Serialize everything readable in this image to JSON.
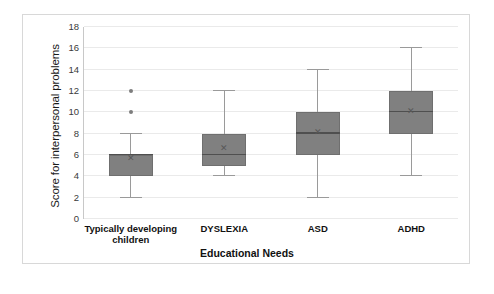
{
  "chart_data": {
    "type": "box",
    "title": "",
    "xlabel": "Educational  Needs",
    "ylabel": "Score for interpersonal problems",
    "ylim": [
      0,
      18
    ],
    "yticks": [
      0,
      2,
      4,
      6,
      8,
      10,
      12,
      14,
      16,
      18
    ],
    "grid": true,
    "legend": "none",
    "categories": [
      "Typically developing children",
      "DYSLEXIA",
      "ASD",
      "ADHD"
    ],
    "boxes": [
      {
        "category": "Typically developing children",
        "whisker_low": 2,
        "q1": 4,
        "median": 6,
        "q3": 6,
        "whisker_high": 8,
        "mean": 5.7,
        "outliers": [
          10,
          12
        ]
      },
      {
        "category": "DYSLEXIA",
        "whisker_low": 4,
        "q1": 5,
        "median": 6,
        "q3": 8,
        "whisker_high": 12,
        "mean": 6.7,
        "outliers": []
      },
      {
        "category": "ASD",
        "whisker_low": 2,
        "q1": 6,
        "median": 8,
        "q3": 10,
        "whisker_high": 14,
        "mean": 8.2,
        "outliers": []
      },
      {
        "category": "ADHD",
        "whisker_low": 4,
        "q1": 8,
        "median": 10,
        "q3": 12,
        "whisker_high": 16,
        "mean": 10.1,
        "outliers": []
      }
    ],
    "colors": {
      "box_fill": "#808080",
      "box_edge": "#6f6f6f",
      "median": "#4f4f4f",
      "whisker": "#9a9a9a",
      "outlier": "#7d7d7d",
      "grid": "#eaeaea",
      "background": "#ffffff"
    },
    "mean_marker_glyph": "✕"
  }
}
